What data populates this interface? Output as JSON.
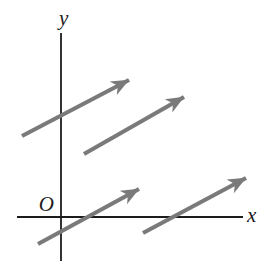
{
  "figure": {
    "type": "vector-diagram",
    "background_color": "#ffffff",
    "axis_color": "#1c1c1c",
    "arrow_color": "#7a7a7a",
    "labels": {
      "y_axis": "y",
      "x_axis": "x",
      "origin": "O"
    },
    "axes": {
      "y_axis": {
        "x": 61,
        "y1": 33,
        "y2": 261
      },
      "x_axis": {
        "y": 217,
        "x1": 17,
        "x2": 243
      }
    },
    "vectors": [
      {
        "x1": 22,
        "y1": 136,
        "x2": 129,
        "y2": 80
      },
      {
        "x1": 84,
        "y1": 154,
        "x2": 184,
        "y2": 97
      },
      {
        "x1": 38,
        "y1": 244,
        "x2": 139,
        "y2": 189
      },
      {
        "x1": 143,
        "y1": 233,
        "x2": 246,
        "y2": 178
      }
    ]
  }
}
